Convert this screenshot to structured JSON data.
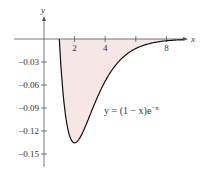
{
  "chart_data": {
    "type": "area",
    "title": "",
    "equation": "y = (1 − x)e^−x",
    "xlabel": "x",
    "ylabel": "y",
    "xlim": [
      -0.5,
      9.2
    ],
    "ylim": [
      -0.16,
      0.02
    ],
    "x_ticks": [
      2,
      4,
      6,
      8
    ],
    "x_tick_labels": [
      "2",
      "4",
      "",
      "8"
    ],
    "y_ticks": [
      -0.03,
      -0.06,
      -0.09,
      -0.12,
      -0.15
    ],
    "y_tick_labels": [
      "−0.03",
      "−0.06",
      "−0.09",
      "−0.12",
      "−0.15"
    ],
    "shaded_region": {
      "from_x": 1,
      "to_x": 9,
      "color": "#f7e6e6"
    },
    "curve_color": "#111111",
    "grid": false,
    "x": [
      1,
      1.5,
      2,
      3,
      4,
      5,
      6,
      7,
      8,
      9
    ],
    "values": [
      0,
      -0.112,
      -0.135,
      -0.1,
      -0.055,
      -0.027,
      -0.012,
      -0.0055,
      -0.0023,
      -0.001
    ]
  },
  "labels": {
    "x_axis": "x",
    "y_axis": "y",
    "equation_main": "y = (1 − x)e",
    "equation_exp": "−x"
  }
}
